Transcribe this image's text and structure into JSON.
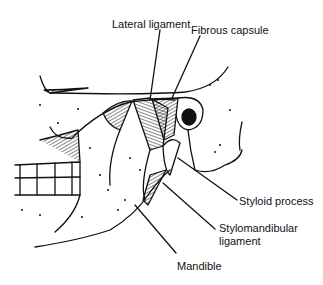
{
  "figure": {
    "labels": {
      "lateral_ligament": "Lateral ligament",
      "fibrous_capsule": "Fibrous capsule",
      "styloid_process": "Styloid process",
      "stylomandibular_ligament_line1": "Stylomandibular",
      "stylomandibular_ligament_line2": "ligament",
      "mandible": "Mandible"
    }
  }
}
